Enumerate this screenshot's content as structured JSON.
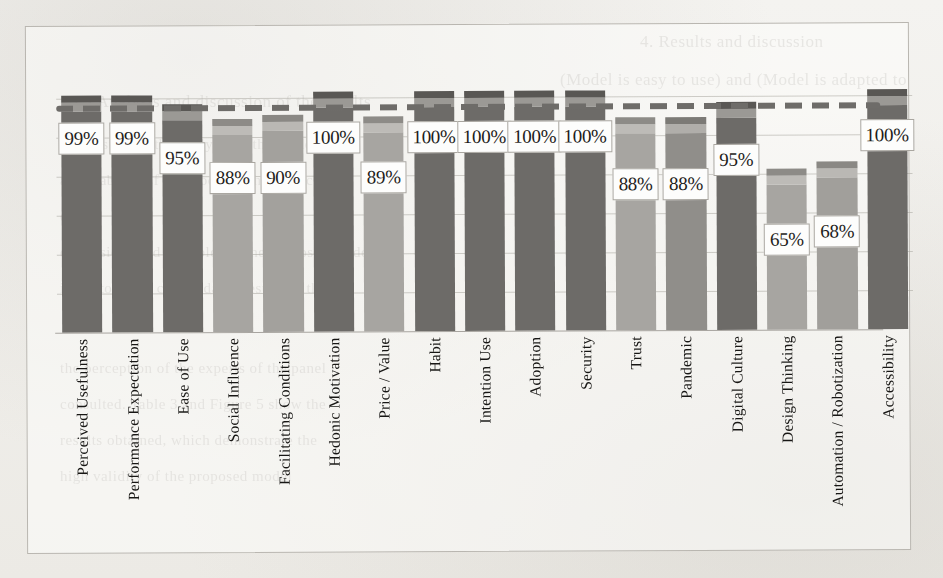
{
  "figure": {
    "kind": "scanned-bar-chart",
    "frame_border_color": "#b9b6b0",
    "page_background": "#f3f2ef"
  },
  "background_text": [
    {
      "text": "4. Results and discussion"
    },
    {
      "text": "(Model is easy to use) and (Model is adapted to"
    },
    {
      "text": "3.3 Analysis and discussion of the results"
    },
    {
      "text": "4.1 Results of the analysis of the model"
    },
    {
      "text": "applicability of the model in the public"
    },
    {
      "text": "e"
    },
    {
      "text": "dimensions and variables of the proposed model"
    },
    {
      "text": "indicators, the consolidated results in the"
    },
    {
      "text": "the perception of the experts of the panel"
    },
    {
      "text": "consulted. Table 3 and Figure 5 show the"
    },
    {
      "text": "results obtained, which demonstrate the"
    },
    {
      "text": "high validity of the proposed model"
    }
  ],
  "chart_data": {
    "type": "bar",
    "title": "",
    "xlabel": "",
    "ylabel": "",
    "ylim": [
      0,
      110
    ],
    "grid": true,
    "legend_position": "none",
    "value_label_suffix": "%",
    "target_line": {
      "value": 100,
      "style": "dashed",
      "color": "#6e6c69"
    },
    "categories": [
      "Perceived Usefulness",
      "Performance Expectation",
      "Ease of Use",
      "Social Influence",
      "Facilitating Conditions",
      "Hedonic Motivation",
      "Price / Value",
      "Habit",
      "Intention Use",
      "Adoption",
      "Security",
      "Trust",
      "Pandemic",
      "Digital Culture",
      "Design Thinking",
      "Automation / Robotization",
      "Accessibility"
    ],
    "values": [
      99,
      99,
      95,
      88,
      90,
      100,
      89,
      100,
      100,
      100,
      100,
      88,
      88,
      95,
      65,
      68,
      100
    ],
    "labels": [
      "99%",
      "99%",
      "95%",
      "88%",
      "90%",
      "100%",
      "89%",
      "100%",
      "100%",
      "100%",
      "100%",
      "88%",
      "88%",
      "95%",
      "65%",
      "68%",
      "100%"
    ],
    "bar_colors": [
      "#6d6b68",
      "#6d6b68",
      "#6d6b68",
      "#a7a5a1",
      "#a3a19d",
      "#6d6b68",
      "#a7a5a1",
      "#6d6b68",
      "#6d6b68",
      "#6d6b68",
      "#6d6b68",
      "#a7a5a1",
      "#908e8a",
      "#6d6b68",
      "#a7a5a1",
      "#a19f9b",
      "#6d6b68"
    ],
    "cap_colors": [
      "#9b9995",
      "#9b9995",
      "#9b9995",
      "#bdbbb7",
      "#bab8b4",
      "#9b9995",
      "#bdbbb7",
      "#9b9995",
      "#9b9995",
      "#9b9995",
      "#9b9995",
      "#bdbbb7",
      "#b0aeaa",
      "#9b9995",
      "#bdbbb7",
      "#bab8b4",
      "#9b9995"
    ],
    "tip_colors": [
      "#595754",
      "#595754",
      "#595754",
      "#8d8b87",
      "#8a8884",
      "#595754",
      "#8d8b87",
      "#595754",
      "#595754",
      "#595754",
      "#595754",
      "#8d8b87",
      "#7c7a76",
      "#595754",
      "#8d8b87",
      "#8a8884",
      "#595754"
    ]
  }
}
